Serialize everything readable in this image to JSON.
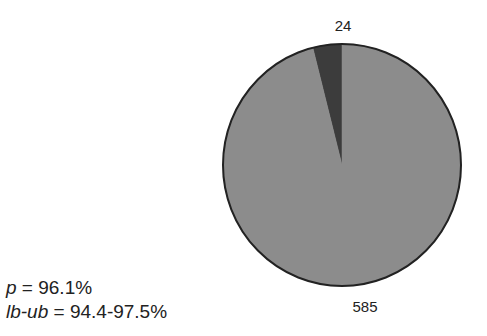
{
  "chart_data": {
    "type": "pie",
    "title": "",
    "slices": [
      {
        "label": "24",
        "value": 24,
        "color": "#3c3c3c"
      },
      {
        "label": "585",
        "value": 585,
        "color": "#8c8c8c"
      }
    ],
    "start_angle": "12 o'clock",
    "direction": "counter-clockwise for small slice",
    "outline_color": "#222222",
    "legend": "none"
  },
  "stats": {
    "p_var": "p",
    "p_text": " = 96.1%",
    "ci_var": "lb-ub",
    "ci_text": " = 94.4-97.5%"
  }
}
